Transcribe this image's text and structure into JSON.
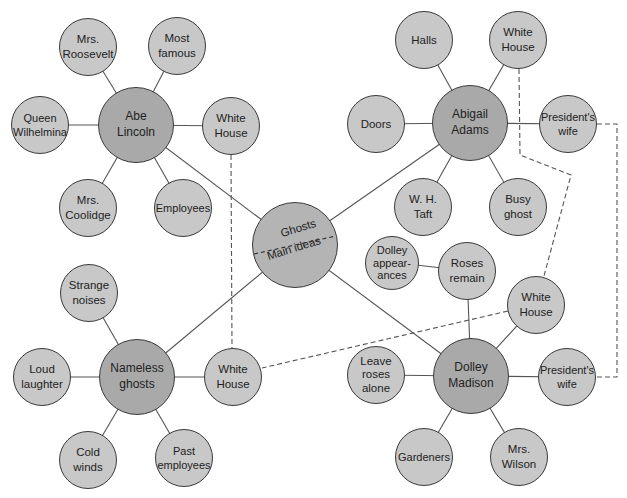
{
  "diagram": {
    "type": "semantic-web",
    "center": {
      "top_label": "Ghosts",
      "bottom_label": "Main ideas"
    },
    "hubs": [
      {
        "id": "abe",
        "label": "Abe\nLincoln",
        "children": [
          "Mrs.\nRoosevelt",
          "Most\nfamous",
          "Queen\nWilhelmina",
          "White\nHouse",
          "Mrs.\nCoolidge",
          "Employees"
        ]
      },
      {
        "id": "abigail",
        "label": "Abigail\nAdams",
        "children": [
          "Halls",
          "White\nHouse",
          "Doors",
          "President's\nwife",
          "W. H.\nTaft",
          "Busy\nghost"
        ]
      },
      {
        "id": "nameless",
        "label": "Nameless\nghosts",
        "children": [
          "Strange\nnoises",
          "Loud\nlaughter",
          "White\nHouse",
          "Cold\nwinds",
          "Past\nemployees"
        ]
      },
      {
        "id": "dolley",
        "label": "Dolley\nMadison",
        "children": [
          "Dolley\nappear-\nances",
          "Roses\nremain",
          "White\nHouse",
          "Leave\nroses\nalone",
          "President's\nwife",
          "Gardeners",
          "Mrs.\nWilson"
        ]
      }
    ],
    "dashed_links": [
      "White House (Abe Lincoln) — White House (Nameless ghosts)",
      "White House (Abigail Adams) — White House (Dolley Madison) — White House (Nameless ghosts)",
      "President's wife (Abigail Adams) — President's wife (Dolley Madison)"
    ],
    "colors": {
      "hub_fill": "#a9a9a9",
      "leaf_fill": "#c8c8c8",
      "stroke": "#3a3a3a"
    }
  }
}
